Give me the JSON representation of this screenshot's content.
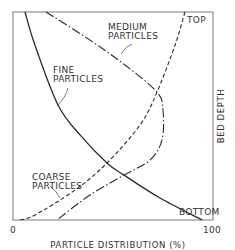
{
  "chart_data": {
    "type": "line",
    "title": "",
    "xlabel": "PARTICLE DISTRIBUTION (%)",
    "ylabel": "BED DEPTH",
    "xlim": [
      0,
      100
    ],
    "ylim": [
      0,
      100
    ],
    "y_direction": "top-to-bottom (0 = TOP, 100 = BOTTOM)",
    "x_ticks": [
      "0",
      "100"
    ],
    "y_tick_labels": {
      "top": "TOP",
      "bottom": "BOTTOM"
    },
    "grid": false,
    "legend": "inline annotations",
    "series": [
      {
        "name": "FINE PARTICLES",
        "style": "solid",
        "points": [
          [
            6,
            0
          ],
          [
            11,
            16
          ],
          [
            22.5,
            44.7
          ],
          [
            33.5,
            59.1
          ],
          [
            47,
            72.6
          ],
          [
            55.5,
            78.4
          ],
          [
            73.5,
            89.4
          ],
          [
            94.5,
            100
          ]
        ]
      },
      {
        "name": "MEDIUM PARTICLES",
        "style": "dash-dot",
        "points": [
          [
            16.5,
            0
          ],
          [
            38.5,
            13.5
          ],
          [
            56,
            25.5
          ],
          [
            72,
            38.5
          ],
          [
            75,
            47.1
          ],
          [
            74.5,
            61.5
          ],
          [
            68.5,
            71.2
          ],
          [
            55.5,
            78.4
          ],
          [
            38.5,
            88
          ],
          [
            22,
            100
          ]
        ]
      },
      {
        "name": "COARSE PARTICLES",
        "style": "dashed",
        "points": [
          [
            86,
            0
          ],
          [
            81,
            16
          ],
          [
            72,
            38.5
          ],
          [
            63.5,
            54.3
          ],
          [
            47,
            72.6
          ],
          [
            31,
            85.6
          ],
          [
            11,
            97.6
          ],
          [
            3.5,
            100
          ]
        ]
      }
    ],
    "annotations": [
      {
        "text": "MEDIUM PARTICLES",
        "points_to": "MEDIUM PARTICLES"
      },
      {
        "text": "FINE PARTICLES",
        "points_to": "FINE PARTICLES"
      },
      {
        "text": "COARSE PARTICLES",
        "points_to": "COARSE PARTICLES"
      },
      {
        "text": "TOP",
        "position": "top-right"
      },
      {
        "text": "BOTTOM",
        "position": "bottom-right"
      }
    ]
  },
  "labels": {
    "medium_line1": "MEDIUM",
    "medium_line2": "PARTICLES",
    "fine_line1": "FINE",
    "fine_line2": "PARTICLES",
    "coarse_line1": "COARSE",
    "coarse_line2": "PARTICLES",
    "top": "TOP",
    "bottom": "BOTTOM",
    "x_min": "0",
    "x_max": "100",
    "xlabel": "PARTICLE DISTRIBUTION (%)",
    "ylabel": "BED DEPTH"
  },
  "frame": {
    "left": 13,
    "top": 12,
    "right": 213,
    "bottom": 220
  },
  "colors": {
    "line": "#2a2a2a",
    "frame": "#555555",
    "text": "#333333"
  }
}
